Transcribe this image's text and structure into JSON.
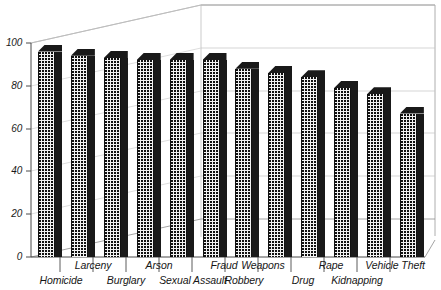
{
  "chart_data": {
    "type": "bar",
    "title": "",
    "subtitle": "",
    "xlabel": "",
    "ylabel": "",
    "categories": [
      "Homicide",
      "Larceny",
      "Burglary",
      "Arson",
      "Sexual Assault",
      "Fraud",
      "Robbery",
      "Weapons",
      "Drug",
      "Rape",
      "Kidnapping",
      "Vehicle Theft"
    ],
    "values": [
      96,
      94,
      93,
      92,
      92,
      92,
      88,
      86,
      84,
      79,
      76,
      67
    ],
    "ylim": [
      0,
      100
    ],
    "yticks": [
      0,
      20,
      40,
      60,
      80,
      100
    ],
    "ytick_labels": [
      "0",
      "20",
      "40",
      "60",
      "80",
      "100"
    ],
    "grid": true,
    "legend": "none",
    "style_3d": true,
    "series": [
      {
        "name": "",
        "values": [
          96,
          94,
          93,
          92,
          92,
          92,
          88,
          86,
          84,
          79,
          76,
          67
        ]
      }
    ],
    "colors": {
      "bar_face": "#f2f2f2",
      "bar_pattern": "#101010",
      "bar_side": "#191919",
      "grid": "#b9b9b9",
      "axis": "#555555",
      "text": "#161616",
      "background": "#ffffff"
    }
  },
  "axis": {
    "y": {
      "ticks": [
        {
          "label": "100"
        },
        {
          "label": "80"
        },
        {
          "label": "60"
        },
        {
          "label": "40"
        },
        {
          "label": "20"
        },
        {
          "label": "0"
        }
      ]
    },
    "x": {
      "upper_row": [
        "Larceny",
        "Arson",
        "Fraud",
        "Weapons",
        "Rape",
        "Vehicle Theft"
      ],
      "lower_row": [
        "Homicide",
        "Burglary",
        "Sexual Assault",
        "Robbery",
        "Drug",
        "Kidnapping"
      ]
    }
  }
}
